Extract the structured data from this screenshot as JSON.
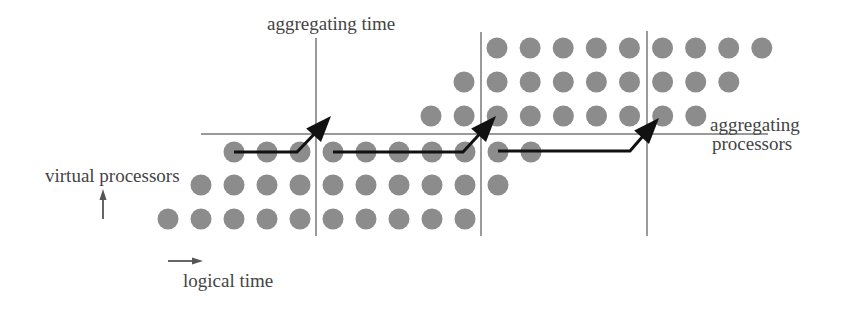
{
  "labels": {
    "aggregating_time": "aggregating time",
    "aggregating_processors_line1": "aggregating",
    "aggregating_processors_line2": "processors",
    "virtual_processors": "virtual processors",
    "logical_time": "logical time"
  },
  "colors": {
    "dot": "#8c8c8c",
    "guide_line": "#9a9a9a",
    "arrow": "#111111",
    "axis_arrow": "#555555",
    "text": "#444444"
  },
  "dot_radius": 10.5,
  "dot_rows": [
    {
      "y": 48,
      "x_start": 497,
      "count": 9,
      "spacing": 33.1
    },
    {
      "y": 82,
      "x_start": 464,
      "count": 9,
      "spacing": 33.1
    },
    {
      "y": 116,
      "x_start": 431,
      "count": 9,
      "spacing": 33.1
    },
    {
      "y": 152,
      "x_start": 234,
      "count": 10,
      "spacing": 33.0
    },
    {
      "y": 185,
      "x_start": 201,
      "count": 10,
      "spacing": 33.0
    },
    {
      "y": 219,
      "x_start": 168,
      "count": 10,
      "spacing": 33.0
    }
  ],
  "vertical_lines": [
    {
      "x": 316,
      "y1": 38,
      "y2": 236
    },
    {
      "x": 481,
      "y1": 32,
      "y2": 236
    },
    {
      "x": 647,
      "y1": 31,
      "y2": 236
    }
  ],
  "horizontal_line": {
    "y": 134,
    "x1": 201,
    "x2": 768
  },
  "aggregation_arrows": [
    {
      "points": "234,152 297,152 322,126",
      "tip": [
        331,
        116
      ]
    },
    {
      "points": "333,152 463,152 487,126",
      "tip": [
        496,
        116
      ]
    },
    {
      "points": "498,151 630,151 650,128",
      "tip": [
        659,
        118
      ]
    }
  ]
}
